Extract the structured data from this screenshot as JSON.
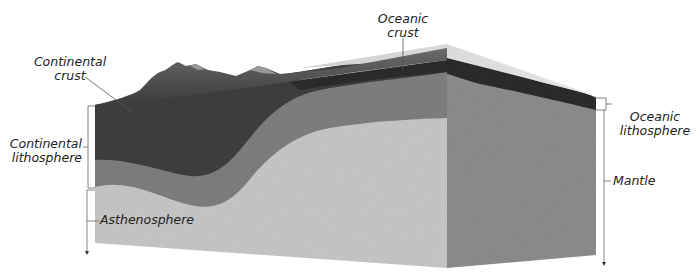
{
  "diagram": {
    "type": "cross-section block diagram",
    "labels": {
      "continental_crust": [
        "Continental",
        "crust"
      ],
      "oceanic_crust": [
        "Oceanic",
        "crust"
      ],
      "continental_lithosphere": [
        "Continental",
        "lithosphere"
      ],
      "oceanic_lithosphere": [
        "Oceanic",
        "lithosphere"
      ],
      "asthenosphere": "Asthenosphere",
      "mantle": "Mantle"
    },
    "colors": {
      "continental_crust": "#3c3c3c",
      "lithospheric_mantle": "#7c7c7c",
      "asthenosphere": "#c4c4c4",
      "oceanic_crust": "#2a2a2a",
      "ocean_top": "#bdbdbd",
      "side_face": "#8a8a8a",
      "mountains": "#4a4a4a",
      "leader_lines": "#666666"
    }
  }
}
